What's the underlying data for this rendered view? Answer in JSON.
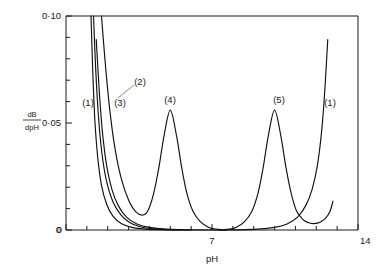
{
  "chart_data": {
    "type": "line",
    "title": "",
    "xlabel": "pH",
    "ylabel": "dB/dpH",
    "ylabel_numerator": "dB",
    "ylabel_denominator": "dpH",
    "xlim": [
      0,
      14
    ],
    "ylim": [
      0,
      0.1
    ],
    "grid": false,
    "legend_position": "inline-annotations",
    "x_major_ticks": [
      0,
      7,
      14
    ],
    "x_major_tick_labels": [
      "0",
      "7",
      "14"
    ],
    "x_minor_tick_step": 1,
    "y_major_ticks": [
      0,
      0.05,
      0.1
    ],
    "y_major_tick_labels": [
      "0",
      "0·05",
      "0·10"
    ],
    "y_minor_tick_step": 0.01,
    "annotations": [
      {
        "text": "(1)",
        "x_px": 88,
        "y_px": 103,
        "curve": 1,
        "note": "left branch of strong acid/base curve"
      },
      {
        "text": "(2)",
        "x_px": 137,
        "y_px": 82,
        "curve": 2,
        "leader_to_px": [
          118,
          98
        ]
      },
      {
        "text": "(3)",
        "x_px": 118,
        "y_px": 103,
        "curve": 3
      },
      {
        "text": "(4)",
        "x_px": 168,
        "y_px": 102,
        "curve": 4,
        "note": "above peak at pH 5"
      },
      {
        "text": "(5)",
        "x_px": 277,
        "y_px": 102,
        "curve": 5,
        "note": "above peak at pH 10"
      },
      {
        "text": "(1)",
        "x_px": 327,
        "y_px": 103,
        "curve": 1,
        "note": "right branch of strong acid/base curve"
      }
    ],
    "series": [
      {
        "name": "(1)",
        "label": "(1)",
        "description": "Strong acid / strong base buffer capacity; U-shaped, minimum near pH 7",
        "points": [
          {
            "x": 1.45,
            "y": 0.089
          },
          {
            "x": 1.6,
            "y": 0.064
          },
          {
            "x": 1.75,
            "y": 0.0455
          },
          {
            "x": 1.95,
            "y": 0.03
          },
          {
            "x": 2.2,
            "y": 0.019
          },
          {
            "x": 2.5,
            "y": 0.0115
          },
          {
            "x": 2.9,
            "y": 0.006
          },
          {
            "x": 3.4,
            "y": 0.0028
          },
          {
            "x": 4.0,
            "y": 0.0012
          },
          {
            "x": 5.0,
            "y": 0.0003
          },
          {
            "x": 7.0,
            "y": 0.0
          },
          {
            "x": 9.0,
            "y": 0.0003
          },
          {
            "x": 10.0,
            "y": 0.0012
          },
          {
            "x": 10.6,
            "y": 0.0028
          },
          {
            "x": 11.1,
            "y": 0.006
          },
          {
            "x": 11.5,
            "y": 0.0115
          },
          {
            "x": 11.8,
            "y": 0.019
          },
          {
            "x": 12.05,
            "y": 0.03
          },
          {
            "x": 12.25,
            "y": 0.0455
          },
          {
            "x": 12.4,
            "y": 0.064
          },
          {
            "x": 12.55,
            "y": 0.089
          }
        ]
      },
      {
        "name": "(2)",
        "label": "(2)",
        "description": "Steep descending curve from upper left; merges toward baseline near pH 4",
        "points": [
          {
            "x": 1.2,
            "y": 0.1
          },
          {
            "x": 1.28,
            "y": 0.075
          },
          {
            "x": 1.38,
            "y": 0.052
          },
          {
            "x": 1.52,
            "y": 0.034
          },
          {
            "x": 1.7,
            "y": 0.021
          },
          {
            "x": 1.95,
            "y": 0.012
          },
          {
            "x": 2.25,
            "y": 0.0065
          },
          {
            "x": 2.65,
            "y": 0.003
          },
          {
            "x": 3.15,
            "y": 0.0012
          },
          {
            "x": 3.8,
            "y": 0.0004
          },
          {
            "x": 4.6,
            "y": 0.0001
          },
          {
            "x": 5.5,
            "y": 0.0
          }
        ]
      },
      {
        "name": "(3)",
        "label": "(3)",
        "description": "Steep descending curve, slightly to the right of (2), levels off near pH 5",
        "points": [
          {
            "x": 1.32,
            "y": 0.1
          },
          {
            "x": 1.42,
            "y": 0.076
          },
          {
            "x": 1.55,
            "y": 0.054
          },
          {
            "x": 1.72,
            "y": 0.036
          },
          {
            "x": 1.95,
            "y": 0.0225
          },
          {
            "x": 2.25,
            "y": 0.0132
          },
          {
            "x": 2.62,
            "y": 0.0072
          },
          {
            "x": 3.05,
            "y": 0.0035
          },
          {
            "x": 3.55,
            "y": 0.0015
          },
          {
            "x": 4.2,
            "y": 0.0005
          },
          {
            "x": 5.0,
            "y": 0.0001
          },
          {
            "x": 6.0,
            "y": 0.0
          }
        ]
      },
      {
        "name": "(4)",
        "label": "(4)",
        "description": "Weak acid buffer, symmetric peak centred at pH 5, maximum 0.056",
        "peak_x": 5.0,
        "peak_y": 0.056,
        "points": [
          {
            "x": 1.7,
            "y": 0.1
          },
          {
            "x": 1.9,
            "y": 0.076
          },
          {
            "x": 2.1,
            "y": 0.056
          },
          {
            "x": 2.35,
            "y": 0.038
          },
          {
            "x": 2.65,
            "y": 0.024
          },
          {
            "x": 3.0,
            "y": 0.014
          },
          {
            "x": 3.35,
            "y": 0.0085
          },
          {
            "x": 3.7,
            "y": 0.007
          },
          {
            "x": 3.95,
            "y": 0.0095
          },
          {
            "x": 4.2,
            "y": 0.017
          },
          {
            "x": 4.45,
            "y": 0.029
          },
          {
            "x": 4.7,
            "y": 0.044
          },
          {
            "x": 5.0,
            "y": 0.056
          },
          {
            "x": 5.3,
            "y": 0.044
          },
          {
            "x": 5.55,
            "y": 0.029
          },
          {
            "x": 5.8,
            "y": 0.017
          },
          {
            "x": 6.1,
            "y": 0.0085
          },
          {
            "x": 6.45,
            "y": 0.0038
          },
          {
            "x": 6.85,
            "y": 0.0012
          },
          {
            "x": 7.2,
            "y": 0.0004
          },
          {
            "x": 7.7,
            "y": 0.0
          }
        ]
      },
      {
        "name": "(5)",
        "label": "(5)",
        "description": "Weak base buffer, symmetric peak centred at pH 10, maximum 0.056",
        "peak_x": 10.0,
        "peak_y": 0.056,
        "points": [
          {
            "x": 7.3,
            "y": 0.0
          },
          {
            "x": 7.8,
            "y": 0.0004
          },
          {
            "x": 8.15,
            "y": 0.0012
          },
          {
            "x": 8.55,
            "y": 0.0038
          },
          {
            "x": 8.9,
            "y": 0.0085
          },
          {
            "x": 9.2,
            "y": 0.017
          },
          {
            "x": 9.45,
            "y": 0.029
          },
          {
            "x": 9.7,
            "y": 0.044
          },
          {
            "x": 10.0,
            "y": 0.056
          },
          {
            "x": 10.3,
            "y": 0.044
          },
          {
            "x": 10.55,
            "y": 0.029
          },
          {
            "x": 10.8,
            "y": 0.017
          },
          {
            "x": 11.05,
            "y": 0.009
          },
          {
            "x": 11.35,
            "y": 0.005
          },
          {
            "x": 11.6,
            "y": 0.0035
          },
          {
            "x": 11.85,
            "y": 0.003
          },
          {
            "x": 12.05,
            "y": 0.0032
          },
          {
            "x": 12.25,
            "y": 0.004
          },
          {
            "x": 12.45,
            "y": 0.0055
          },
          {
            "x": 12.65,
            "y": 0.0085
          },
          {
            "x": 12.8,
            "y": 0.0135
          }
        ]
      }
    ]
  },
  "axes": {
    "x_title": "pH",
    "y_title_numerator": "dB",
    "y_title_denominator": "dpH",
    "x_labels": [
      "0",
      "7",
      "14"
    ],
    "y_labels": [
      "0",
      "0·05",
      "0·10"
    ]
  },
  "labels": {
    "c1_left": "(1)",
    "c2": "(2)",
    "c3": "(3)",
    "c4": "(4)",
    "c5": "(5)",
    "c1_right": "(1)"
  },
  "colors": {
    "curve": "#111111",
    "axis": "#1a1a1a",
    "background": "#ffffff",
    "leader": "#555555"
  }
}
